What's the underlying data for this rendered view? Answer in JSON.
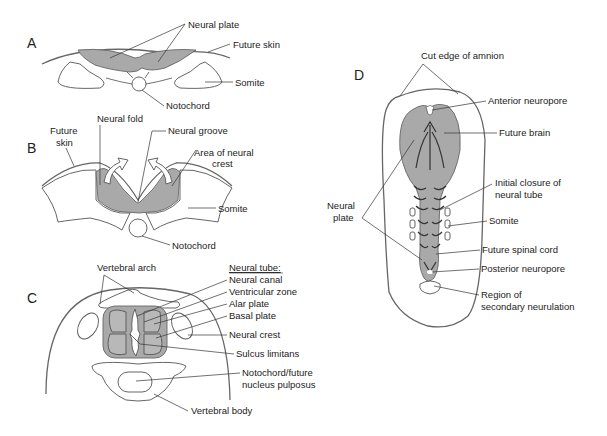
{
  "figure": {
    "panels": {
      "A": {
        "letter": "A",
        "labels": [
          "Neural plate",
          "Future skin",
          "Somite",
          "Notochord"
        ]
      },
      "B": {
        "letter": "B",
        "labels": [
          "Neural fold",
          "Neural groove",
          "Future",
          "skin",
          "Area of neural",
          "crest",
          "Somite",
          "Notochord"
        ]
      },
      "C": {
        "letter": "C",
        "labels": [
          "Vertebral arch",
          "Neural tube:",
          "Neural canal",
          "Ventricular zone",
          "Alar plate",
          "Basal plate",
          "Neural crest",
          "Sulcus limitans",
          "Notochord/future",
          "nucleus pulposus",
          "Vertebral body"
        ]
      },
      "D": {
        "letter": "D",
        "labels": [
          "Cut edge of amnion",
          "Anterior neuropore",
          "Future brain",
          "Neural",
          "plate",
          "Initial closure of",
          "neural tube",
          "Somite",
          "Future spinal cord",
          "Posterior neuropore",
          "Region of",
          "secondary neurulation"
        ]
      }
    }
  }
}
